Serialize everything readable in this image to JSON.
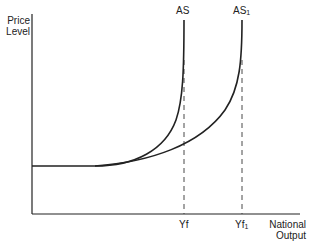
{
  "axes": {
    "y_label_line1": "Price",
    "y_label_line2": "Level",
    "x_label_line1": "National",
    "x_label_line2": "Output"
  },
  "curves": [
    {
      "name": "AS",
      "label": "AS",
      "subscript": ""
    },
    {
      "name": "AS1",
      "label": "AS",
      "subscript": "1"
    }
  ],
  "ticks": [
    {
      "label": "Yf",
      "subscript": ""
    },
    {
      "label": "Yf",
      "subscript": "1"
    }
  ],
  "colors": {
    "line": "#222222",
    "background": "#ffffff"
  }
}
